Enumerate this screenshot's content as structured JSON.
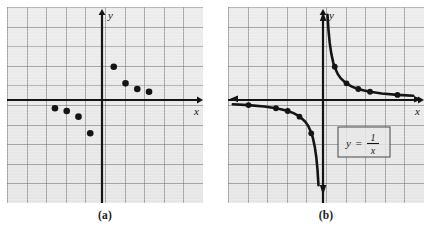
{
  "figure": {
    "panels": [
      {
        "id": "a",
        "caption": "(a)",
        "kind": "scatter",
        "axis_x_label": "x",
        "axis_y_label": "y"
      },
      {
        "id": "b",
        "caption": "(b)",
        "kind": "curve",
        "axis_x_label": "x",
        "axis_y_label": "y",
        "equation_label": {
          "lhs": "y",
          "equals": "=",
          "numerator": "1",
          "denominator": "x",
          "plain": "y = 1/x"
        }
      }
    ],
    "colors": {
      "grid_background": "#eaeaea",
      "grid_line": "#6e6e6e",
      "axis": "#141414",
      "curve": "#141414",
      "point_fill": "#141414",
      "page_background": "#ffffff",
      "equation_box_border": "#555555"
    }
  },
  "chart_data": [
    {
      "type": "scatter",
      "panel": "a",
      "title": "",
      "xlabel": "x",
      "ylabel": "y",
      "xlim": [
        -5.2,
        5.0
      ],
      "ylim": [
        -5.0,
        5.2
      ],
      "grid": true,
      "legend": "none",
      "points": [
        {
          "x": -2.4,
          "y": -0.42
        },
        {
          "x": -1.8,
          "y": -0.56
        },
        {
          "x": -1.2,
          "y": -0.85
        },
        {
          "x": -0.6,
          "y": -1.7
        },
        {
          "x": 0.6,
          "y": 1.7
        },
        {
          "x": 1.2,
          "y": 0.85
        },
        {
          "x": 1.8,
          "y": 0.56
        },
        {
          "x": 2.4,
          "y": 0.42
        }
      ],
      "series": [
        {
          "name": "y = 1/x sample points",
          "x": [
            -2.4,
            -1.8,
            -1.2,
            -0.6,
            0.6,
            1.2,
            1.8,
            2.4
          ],
          "values": [
            -0.42,
            -0.56,
            -0.85,
            -1.7,
            1.7,
            0.85,
            0.56,
            0.42
          ]
        }
      ]
    },
    {
      "type": "line",
      "panel": "b",
      "title": "",
      "subtitle": "",
      "xlabel": "x",
      "ylabel": "y",
      "xlim": [
        -5.2,
        5.0
      ],
      "ylim": [
        -5.0,
        5.2
      ],
      "grid": true,
      "legend": "none",
      "annotations": [
        "y = 1/x"
      ],
      "marked_points": [
        {
          "x": -3.8,
          "y": -0.26
        },
        {
          "x": -2.4,
          "y": -0.42
        },
        {
          "x": -1.8,
          "y": -0.56
        },
        {
          "x": -1.2,
          "y": -0.85
        },
        {
          "x": -0.6,
          "y": -1.7
        },
        {
          "x": 0.6,
          "y": 1.7
        },
        {
          "x": 1.2,
          "y": 0.85
        },
        {
          "x": 1.8,
          "y": 0.56
        },
        {
          "x": 2.4,
          "y": 0.42
        },
        {
          "x": 3.8,
          "y": 0.26
        }
      ],
      "series": [
        {
          "name": "y = 1/x (right branch)",
          "x": [
            0.23,
            0.28,
            0.34,
            0.42,
            0.52,
            0.6,
            0.75,
            0.9,
            1.2,
            1.5,
            1.8,
            2.1,
            2.4,
            3.0,
            3.8,
            4.6
          ],
          "values": [
            4.35,
            3.57,
            2.94,
            2.38,
            1.92,
            1.67,
            1.33,
            1.11,
            0.83,
            0.67,
            0.56,
            0.48,
            0.42,
            0.33,
            0.26,
            0.22
          ]
        },
        {
          "name": "y = 1/x (left branch)",
          "x": [
            -4.6,
            -3.8,
            -3.0,
            -2.4,
            -2.1,
            -1.8,
            -1.5,
            -1.2,
            -0.9,
            -0.75,
            -0.6,
            -0.52,
            -0.42,
            -0.34,
            -0.28,
            -0.23
          ],
          "values": [
            -0.22,
            -0.26,
            -0.33,
            -0.42,
            -0.48,
            -0.56,
            -0.67,
            -0.83,
            -1.11,
            -1.33,
            -1.67,
            -1.92,
            -2.38,
            -2.94,
            -3.57,
            -4.35
          ]
        }
      ]
    }
  ]
}
